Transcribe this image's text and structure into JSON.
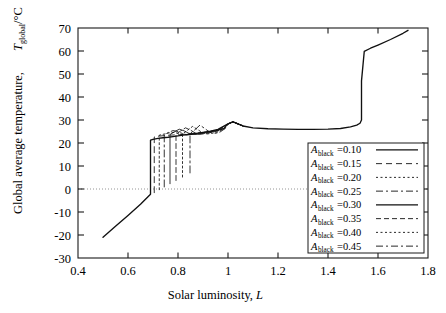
{
  "chart_data": {
    "type": "line",
    "title": "",
    "xlabel": "Solar luminosity, L",
    "ylabel": "Global average temperature, T_global /°C",
    "xlabel_main": "Solar luminosity,",
    "xlabel_sym": "L",
    "ylabel_main": "Global average temperature,",
    "ylabel_sym": "T",
    "ylabel_sub": "global",
    "ylabel_unit": "/°C",
    "xlim": [
      0.4,
      1.8
    ],
    "ylim": [
      -30,
      70
    ],
    "xticks": [
      "0.4",
      "0.6",
      "0.8",
      "1",
      "1.2",
      "1.4",
      "1.6",
      "1.8"
    ],
    "xtick_values": [
      0.4,
      0.6,
      0.8,
      1.0,
      1.2,
      1.4,
      1.6,
      1.8
    ],
    "yticks": [
      "-30",
      "-20",
      "-10",
      "0",
      "10",
      "20",
      "30",
      "40",
      "50",
      "60",
      "70"
    ],
    "ytick_values": [
      -30,
      -20,
      -10,
      0,
      10,
      20,
      30,
      40,
      50,
      60,
      70
    ],
    "grid": false,
    "zero_line": 0,
    "legend_position": "lower-right-inside",
    "legend_prefix": "A",
    "legend_subscript": "black",
    "legend_eq": "=",
    "series": [
      {
        "name": "A_black=0.10",
        "value_label": "0.10",
        "albedo": 0.1,
        "dash": "none",
        "x": [
          0.5,
          0.55,
          0.6,
          0.65,
          0.68,
          0.69,
          0.69,
          0.7,
          0.72,
          0.74,
          0.76,
          0.78,
          0.8,
          0.82,
          0.84,
          0.86,
          0.88,
          0.9,
          0.93,
          0.96,
          1.0,
          1.02,
          1.06,
          1.1,
          1.16,
          1.22,
          1.28,
          1.34,
          1.4,
          1.45,
          1.49,
          1.515,
          1.528,
          1.534,
          1.534,
          1.545,
          1.57,
          1.6,
          1.65,
          1.7,
          1.72
        ],
        "y": [
          -21.0,
          -16.2,
          -11.5,
          -6.6,
          -3.4,
          -2.3,
          21.2,
          21.6,
          22.0,
          22.3,
          22.5,
          22.8,
          23.1,
          23.4,
          23.7,
          24.0,
          24.3,
          24.6,
          25.1,
          25.9,
          28.3,
          29.2,
          27.4,
          26.6,
          26.2,
          26.0,
          25.9,
          25.9,
          26.0,
          26.3,
          27.0,
          27.8,
          28.6,
          30.0,
          47.0,
          59.8,
          61.2,
          62.6,
          65.0,
          67.7,
          69.0
        ]
      },
      {
        "name": "A_black=0.15",
        "value_label": "0.15",
        "albedo": 0.15,
        "dash": "6,4",
        "x": [
          0.705,
          0.705,
          0.725,
          0.745,
          0.765,
          0.785,
          0.805,
          0.825,
          0.845,
          0.865,
          0.885,
          0.905,
          0.935,
          0.965,
          1.0,
          1.02,
          1.06
        ],
        "y": [
          -1.6,
          22.6,
          23.0,
          23.2,
          23.4,
          23.5,
          23.6,
          23.8,
          24.0,
          24.2,
          24.4,
          24.6,
          25.1,
          25.9,
          28.3,
          29.2,
          27.4
        ]
      },
      {
        "name": "A_black=0.20",
        "value_label": "0.20",
        "albedo": 0.2,
        "dash": "2,2.5",
        "x": [
          0.725,
          0.725,
          0.745,
          0.765,
          0.785,
          0.8,
          0.815,
          0.835,
          0.855,
          0.875,
          0.895,
          0.92,
          0.95,
          0.98,
          1.0,
          1.02,
          1.06
        ],
        "y": [
          -0.3,
          23.4,
          23.9,
          24.4,
          24.6,
          24.2,
          23.7,
          23.6,
          23.8,
          24.1,
          24.4,
          24.8,
          25.3,
          26.2,
          28.3,
          29.2,
          27.4
        ]
      },
      {
        "name": "A_black=0.25",
        "value_label": "0.25",
        "albedo": 0.25,
        "dash": "7,3,2,3",
        "x": [
          0.745,
          0.745,
          0.762,
          0.78,
          0.8,
          0.818,
          0.835,
          0.855,
          0.875,
          0.895,
          0.92,
          0.95,
          0.98,
          1.0,
          1.02,
          1.06
        ],
        "y": [
          0.9,
          23.6,
          24.6,
          25.4,
          25.0,
          24.1,
          23.6,
          23.7,
          24.0,
          24.4,
          24.9,
          25.4,
          26.3,
          28.3,
          29.2,
          27.4
        ]
      },
      {
        "name": "A_black=0.30",
        "value_label": "0.30",
        "albedo": 0.3,
        "dash": "none",
        "x": [
          0.768,
          0.768,
          0.786,
          0.805,
          0.824,
          0.842,
          0.86,
          0.88,
          0.9,
          0.925,
          0.955,
          0.985,
          1.0,
          1.02,
          1.06
        ],
        "y": [
          2.3,
          23.7,
          24.9,
          26.0,
          25.3,
          24.3,
          23.7,
          23.8,
          24.2,
          24.8,
          25.4,
          26.4,
          28.3,
          29.2,
          27.4
        ]
      },
      {
        "name": "A_black=0.35",
        "value_label": "0.35",
        "albedo": 0.35,
        "dash": "5,3",
        "x": [
          0.792,
          0.792,
          0.81,
          0.83,
          0.85,
          0.868,
          0.886,
          0.906,
          0.928,
          0.955,
          0.985,
          1.0,
          1.02,
          1.06
        ],
        "y": [
          3.7,
          23.8,
          25.2,
          26.6,
          25.6,
          24.4,
          23.8,
          24.0,
          24.5,
          25.1,
          26.3,
          28.3,
          29.2,
          27.4
        ]
      },
      {
        "name": "A_black=0.40",
        "value_label": "0.40",
        "albedo": 0.4,
        "dash": "2,2.5",
        "x": [
          0.818,
          0.818,
          0.838,
          0.858,
          0.878,
          0.896,
          0.914,
          0.934,
          0.958,
          0.986,
          1.0,
          1.02,
          1.06
        ],
        "y": [
          5.2,
          23.9,
          25.5,
          27.2,
          25.9,
          24.6,
          23.9,
          24.2,
          24.8,
          26.2,
          28.3,
          29.2,
          27.4
        ]
      },
      {
        "name": "A_black=0.45",
        "value_label": "0.45",
        "albedo": 0.45,
        "dash": "7,3,2,3",
        "x": [
          0.848,
          0.848,
          0.868,
          0.888,
          0.908,
          0.926,
          0.944,
          0.966,
          0.99,
          1.0,
          1.02,
          1.06
        ],
        "y": [
          7.0,
          24.0,
          25.8,
          27.8,
          26.2,
          24.8,
          24.1,
          24.6,
          26.4,
          28.3,
          29.2,
          27.4
        ]
      }
    ]
  }
}
